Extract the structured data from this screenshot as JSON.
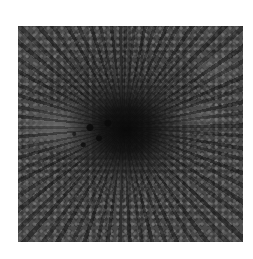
{
  "image": {
    "description": "Grayscale photograph of a sunspot: dark central umbra surrounded by radial penumbral filaments and granulation, with a lighter region extending to the left",
    "background_color": "#ffffff",
    "palette": {
      "umbra": "#0a0a0a",
      "penumbra": "#3a3a3a",
      "granulation": "#6e6e6e",
      "light_region": "#8c8c8c"
    }
  }
}
